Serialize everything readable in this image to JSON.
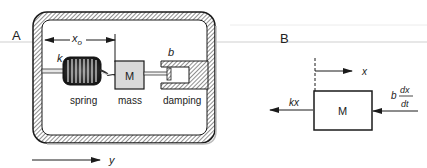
{
  "panels": {
    "a": {
      "label": "A",
      "displacement_label": "x",
      "displacement_subscript": "o",
      "spring_constant_label": "k",
      "damping_constant_label": "b",
      "mass_label": "M",
      "captions": {
        "spring": "spring",
        "mass": "mass",
        "damping": "damping"
      },
      "frame_axis_label": "y"
    },
    "b": {
      "label": "B",
      "mass_label": "M",
      "displacement_label": "x",
      "spring_force_label": "kx",
      "damping_force_coef": "b",
      "damping_force_num": "dx",
      "damping_force_den": "dt"
    }
  },
  "colors": {
    "line": "#1a1a1a",
    "mass_fill": "#d9d9d9",
    "hatch": "#444444",
    "divider": "#cccccc"
  }
}
